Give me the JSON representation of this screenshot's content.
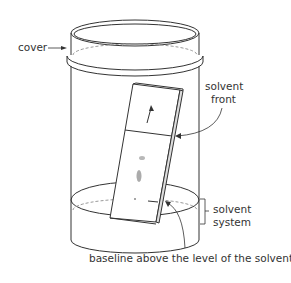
{
  "diagram": {
    "labels": {
      "cover": "cover",
      "solvent_front_line1": "solvent",
      "solvent_front_line2": "front",
      "solvent_system_line1": "solvent",
      "solvent_system_line2": "system",
      "baseline": "baseline above the level of the solvent"
    },
    "colors": {
      "stroke": "#333333",
      "dashed": "#999999",
      "spot": "#888888",
      "background": "#ffffff"
    }
  }
}
